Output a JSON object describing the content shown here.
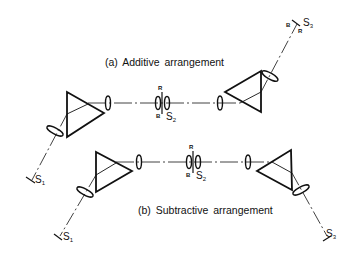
{
  "diagram": {
    "type": "optical-arrangement",
    "panels": [
      {
        "id": "a",
        "caption": "(a) Additive arrangement",
        "labels": {
          "slit1": "S",
          "slit1_sub": "1",
          "slit2": "S",
          "slit2_sub": "2",
          "slit3": "S",
          "slit3_sub": "3",
          "mark_r_center": "R",
          "mark_b_center": "B",
          "mark_b_s3": "B",
          "mark_r_s3": "R"
        }
      },
      {
        "id": "b",
        "caption": "(b) Subtractive arrangement",
        "labels": {
          "slit1": "S",
          "slit1_sub": "1",
          "slit2": "S",
          "slit2_sub": "2",
          "slit3": "S",
          "slit3_sub": "3",
          "mark_r_center": "R",
          "mark_b_center": "B"
        }
      }
    ],
    "components": [
      "prism",
      "lens",
      "slit",
      "optical-axis"
    ],
    "colors": {
      "line": "#111111",
      "background": "#ffffff"
    }
  }
}
